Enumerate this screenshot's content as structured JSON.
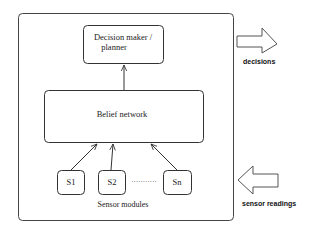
{
  "diagram": {
    "outer_box": {
      "label": ""
    },
    "decision_box": {
      "line1": "Decision maker /",
      "line2": "planner"
    },
    "belief_box": {
      "label": "Belief network"
    },
    "sensors": [
      {
        "label": "S1"
      },
      {
        "label": "S2"
      },
      {
        "label": "Sn"
      }
    ],
    "ellipsis": "···········",
    "sensor_group_label": "Sensor modules",
    "output_arrow": {
      "label": "decisions",
      "direction": "right"
    },
    "input_arrow": {
      "label": "sensor readings",
      "direction": "left"
    }
  },
  "colors": {
    "stroke": "#333333",
    "background": "#ffffff"
  }
}
